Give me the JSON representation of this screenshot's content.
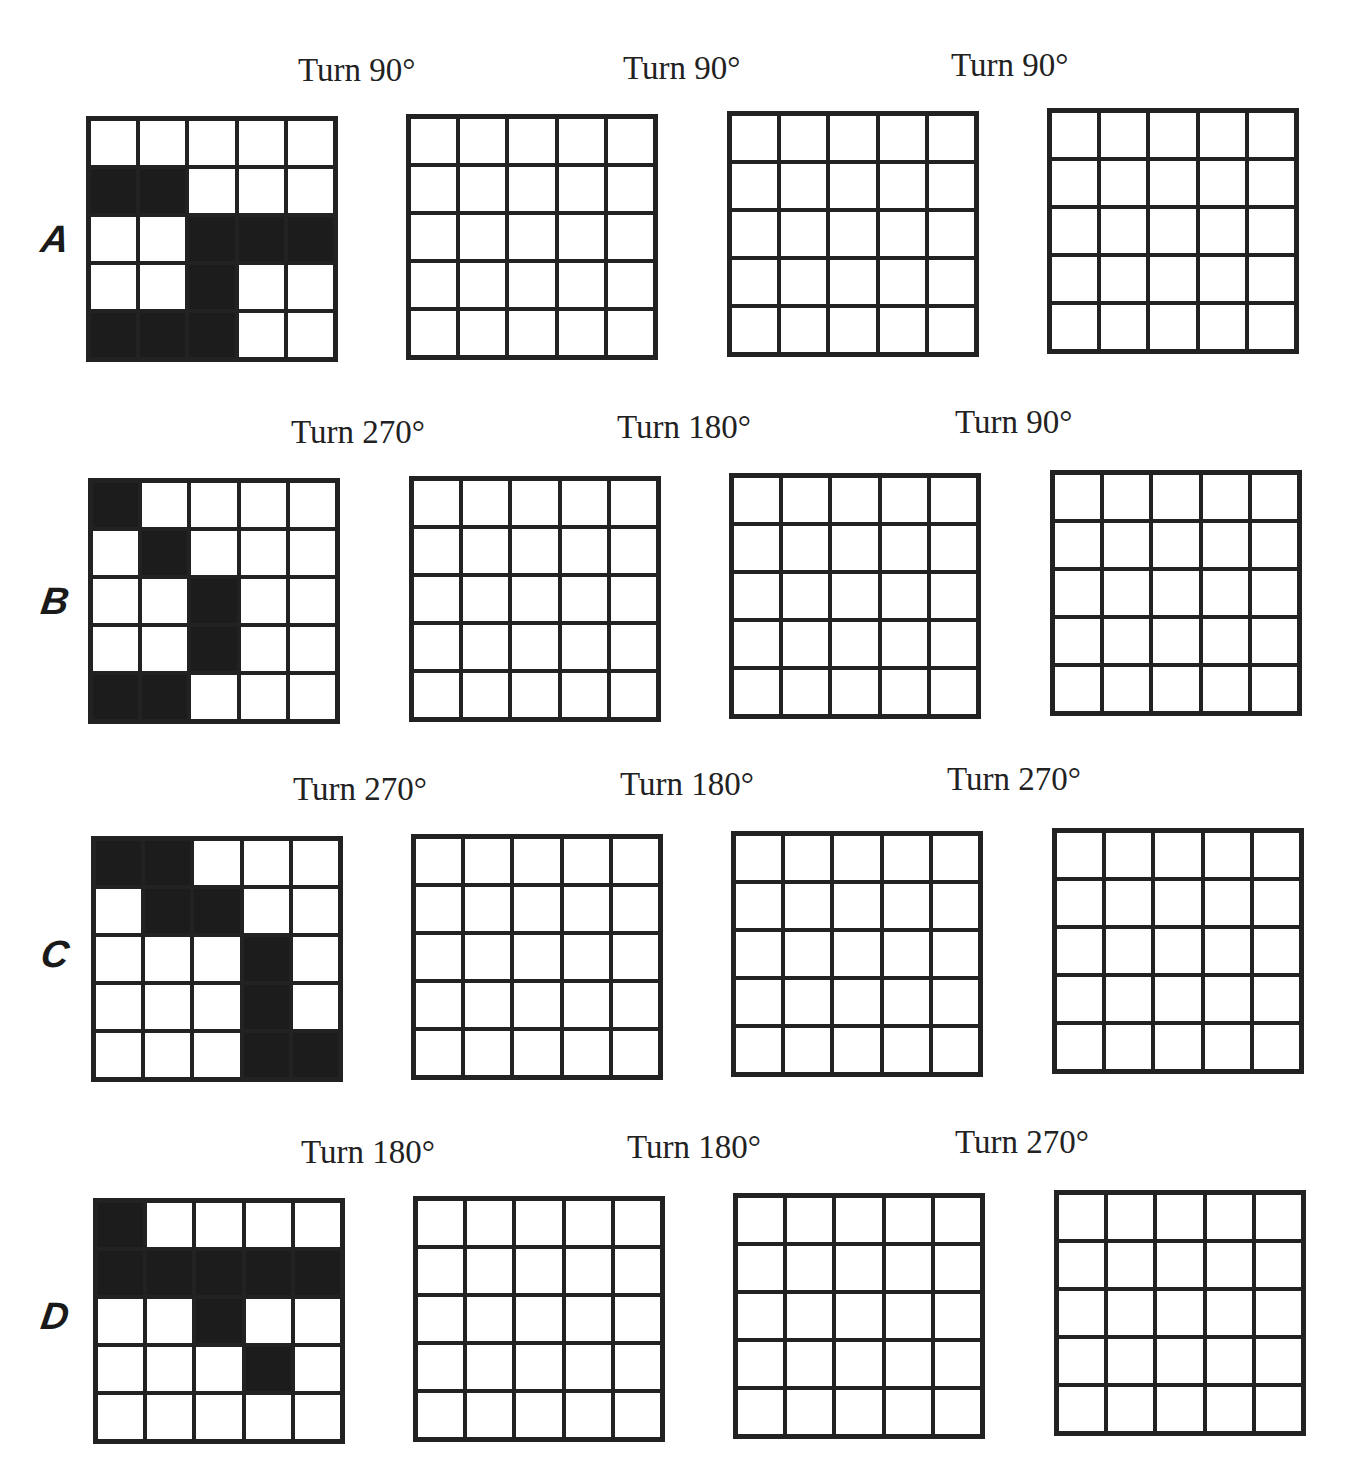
{
  "rows": [
    {
      "letter": "A",
      "turns": [
        "Turn 90°",
        "Turn 90°",
        "Turn 90°"
      ],
      "pattern": [
        [
          0,
          0,
          0,
          0,
          0
        ],
        [
          1,
          1,
          0,
          0,
          0
        ],
        [
          0,
          0,
          1,
          1,
          1
        ],
        [
          0,
          0,
          1,
          0,
          0
        ],
        [
          1,
          1,
          1,
          0,
          0
        ]
      ]
    },
    {
      "letter": "B",
      "turns": [
        "Turn 270°",
        "Turn 180°",
        "Turn 90°"
      ],
      "pattern": [
        [
          1,
          0,
          0,
          0,
          0
        ],
        [
          0,
          1,
          0,
          0,
          0
        ],
        [
          0,
          0,
          1,
          0,
          0
        ],
        [
          0,
          0,
          1,
          0,
          0
        ],
        [
          1,
          1,
          0,
          0,
          0
        ]
      ]
    },
    {
      "letter": "C",
      "turns": [
        "Turn 270°",
        "Turn 180°",
        "Turn 270°"
      ],
      "pattern": [
        [
          1,
          1,
          0,
          0,
          0
        ],
        [
          0,
          1,
          1,
          0,
          0
        ],
        [
          0,
          0,
          0,
          1,
          0
        ],
        [
          0,
          0,
          0,
          1,
          0
        ],
        [
          0,
          0,
          0,
          1,
          1
        ]
      ]
    },
    {
      "letter": "D",
      "turns": [
        "Turn 180°",
        "Turn 180°",
        "Turn 270°"
      ],
      "pattern": [
        [
          1,
          0,
          0,
          0,
          0
        ],
        [
          1,
          1,
          1,
          1,
          1
        ],
        [
          0,
          0,
          1,
          0,
          0
        ],
        [
          0,
          0,
          0,
          1,
          0
        ],
        [
          0,
          0,
          0,
          0,
          0
        ]
      ]
    }
  ],
  "colors": {
    "filled": "#1c1c1c",
    "empty": "#ffffff",
    "line": "#222222"
  }
}
